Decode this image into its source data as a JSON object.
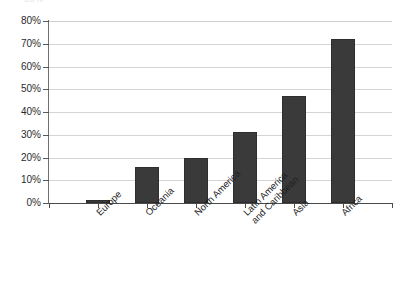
{
  "figure": {
    "top_crop_remnant": "90%"
  },
  "chart_data": {
    "type": "bar",
    "title": "",
    "subtitle": "",
    "xlabel": "",
    "ylabel": "",
    "categories": [
      "Europe",
      "Oceania",
      "North America",
      "Latin America\nand Caribbean",
      "Asia",
      "Africa"
    ],
    "values": [
      1.5,
      16,
      20,
      31,
      47,
      72
    ],
    "value_labels": [
      "1.5%",
      "16%",
      "20%",
      "31%",
      "47%",
      "72%"
    ],
    "ylim": [
      0,
      80
    ],
    "yticks": [
      0,
      10,
      20,
      30,
      40,
      50,
      60,
      70,
      80
    ],
    "ytick_labels": [
      "0%",
      "10%",
      "20%",
      "30%",
      "40%",
      "50%",
      "60%",
      "70%",
      "80%"
    ],
    "grid": true,
    "grid_axis": "y",
    "legend": null,
    "legend_position": "none",
    "bar_color": "#3a3a3a",
    "grid_color": "#d4d4d4",
    "axis_color": "#4a4a4a",
    "text_color": "#1f1f1f",
    "label_rotation_deg": -45
  }
}
